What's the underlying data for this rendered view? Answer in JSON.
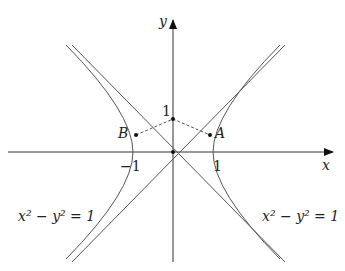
{
  "axes": {
    "x_label": "x",
    "y_label": "y"
  },
  "ticks": {
    "x_neg": "−1",
    "x_pos": "1",
    "y_pos": "1"
  },
  "points": {
    "A": "A",
    "B": "B"
  },
  "equations": {
    "left": "x² − y² = 1",
    "right": "x² − y² = 1"
  },
  "colors": {
    "curve": "#555555",
    "axis": "#333333"
  }
}
